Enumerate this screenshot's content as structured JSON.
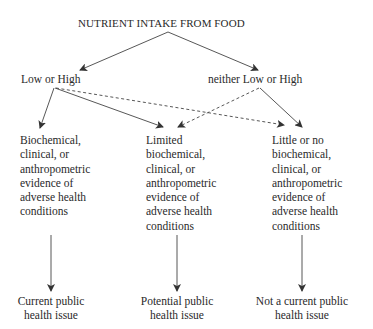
{
  "title": "NUTRIENT INTAKE FROM FOOD",
  "branches": {
    "left": "Low or High",
    "right": "neither Low or High"
  },
  "evidence": [
    {
      "text": "Biochemical,\nclinical, or\nanthropometric\nevidence of\nadverse health\nconditions"
    },
    {
      "text": "Limited\nbiochemical,\nclinical, or\nanthropometric\nevidence of\nadverse health\nconditions"
    },
    {
      "text": "Little or no\nbiochemical,\nclinical, or\nanthropometric\nevidence of\nadverse health\nconditions"
    }
  ],
  "outcomes": [
    {
      "text": "Current public\nhealth issue"
    },
    {
      "text": "Potential public\nhealth issue"
    },
    {
      "text": "Not a current public\nhealth issue"
    }
  ],
  "edges": [
    {
      "from": "title",
      "to": "left",
      "style": "solid"
    },
    {
      "from": "title",
      "to": "right",
      "style": "solid"
    },
    {
      "from": "left",
      "to": "evidence.0",
      "style": "solid"
    },
    {
      "from": "left",
      "to": "evidence.1",
      "style": "solid"
    },
    {
      "from": "left",
      "to": "evidence.2",
      "style": "dashed"
    },
    {
      "from": "right",
      "to": "evidence.1",
      "style": "dashed"
    },
    {
      "from": "right",
      "to": "evidence.2",
      "style": "solid"
    },
    {
      "from": "evidence.0",
      "to": "outcomes.0",
      "style": "solid"
    },
    {
      "from": "evidence.1",
      "to": "outcomes.1",
      "style": "solid"
    },
    {
      "from": "evidence.2",
      "to": "outcomes.2",
      "style": "solid"
    }
  ],
  "colors": {
    "line": "#3a3a3a",
    "text": "#2a2a2a"
  }
}
